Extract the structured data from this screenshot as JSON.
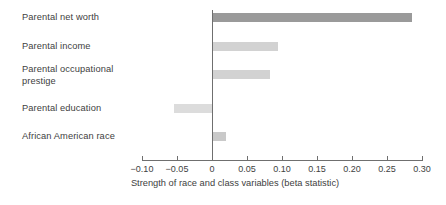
{
  "chart_data": {
    "type": "bar",
    "orientation": "horizontal",
    "title": "",
    "xlabel": "Strength of race and class variables (beta statistic)",
    "ylabel": "",
    "categories": [
      "Parental net worth",
      "Parental income",
      "Parental occupational prestige",
      "Parental education",
      "African American race"
    ],
    "values": [
      0.286,
      0.094,
      0.083,
      -0.054,
      0.02
    ],
    "xlim": [
      -0.1,
      0.3
    ],
    "xticks": [
      -0.1,
      -0.05,
      0,
      0.05,
      0.1,
      0.15,
      0.2,
      0.25,
      0.3
    ],
    "xtick_labels": [
      "−0.10",
      "−0.05",
      "0",
      "0.05",
      "0.10",
      "0.15",
      "0.20",
      "0.25",
      "0.30"
    ],
    "grid": false,
    "legend": null,
    "bar_colors": [
      "#9a9a9a",
      "#d2d2d2",
      "#d2d2d2",
      "#dcdcdc",
      "#c9c9c9"
    ],
    "axis_color": "#6f6f6f",
    "text_color": "#414141",
    "background": "#ffffff"
  },
  "labels": {
    "cat0": "Parental net worth",
    "cat1": "Parental income",
    "cat2_line1": "Parental occupational",
    "cat2_line2": "prestige",
    "cat3": "Parental education",
    "cat4": "African American race"
  },
  "axis": {
    "title": "Strength of race and class variables (beta statistic)",
    "t0": "−0.10",
    "t1": "−0.05",
    "t2": "0",
    "t3": "0.05",
    "t4": "0.10",
    "t5": "0.15",
    "t6": "0.20",
    "t7": "0.25",
    "t8": "0.30"
  }
}
